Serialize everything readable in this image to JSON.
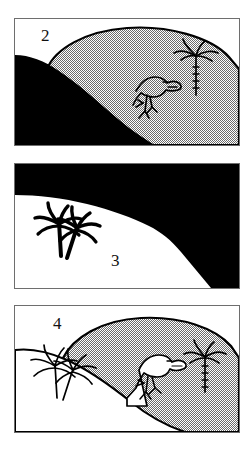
{
  "figure": {
    "background_color": "#ffffff",
    "ink_color": "#000000",
    "halftone_color": "#a8a8a8",
    "panel_border_color": "#6e6e6e",
    "panel_count": 3
  },
  "panels": [
    {
      "id": "panel-2",
      "number": "2",
      "number_position": "top-left",
      "sky_fill": "white",
      "background_hill_fill": "halftone-gray",
      "foreground_hill_fill": "solid-black",
      "figures": [
        {
          "name": "dinosaur",
          "style": "black-outline-on-gray",
          "position": "center"
        },
        {
          "name": "palm-tree",
          "style": "black-outline-on-gray",
          "position": "right"
        }
      ]
    },
    {
      "id": "panel-3",
      "number": "3",
      "number_position": "bottom-center-left",
      "sky_fill": "solid-black",
      "background_hill_fill": "solid-black",
      "foreground_hill_fill": "white",
      "figures": [
        {
          "name": "palm-tree-pair",
          "style": "solid-black-silhouette",
          "position": "left"
        }
      ]
    },
    {
      "id": "panel-4",
      "number": "4",
      "number_position": "top-left",
      "sky_fill": "white",
      "background_hill_fill": "halftone-gray",
      "foreground_hill_fill": "white",
      "figures": [
        {
          "name": "palm-tree-pair",
          "style": "black-outline-on-white",
          "position": "left"
        },
        {
          "name": "dinosaur",
          "style": "black-outline-white-fill",
          "position": "center"
        },
        {
          "name": "palm-tree",
          "style": "black-outline-on-gray",
          "position": "right"
        }
      ]
    }
  ]
}
